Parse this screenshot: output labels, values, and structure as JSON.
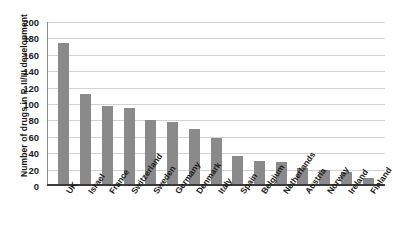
{
  "chart_data": {
    "type": "bar",
    "title": "",
    "xlabel": "",
    "ylabel": "Number of drugs in P. II/III development",
    "ylim": [
      0,
      200
    ],
    "ytick_step": 20,
    "yticks": [
      200,
      180,
      160,
      140,
      120,
      100,
      80,
      60,
      40,
      20,
      0
    ],
    "grid": true,
    "legend": "none",
    "bar_color": "#8a8a8a",
    "categories": [
      "UK",
      "Israel",
      "France",
      "Switzerland",
      "Sweden",
      "Germany",
      "Denmark",
      "Italy",
      "Spain",
      "Belgium",
      "Netherlands",
      "Austria",
      "Norway",
      "Ireland",
      "Finland"
    ],
    "values": [
      174,
      112,
      97,
      95,
      80,
      78,
      69,
      58,
      36,
      31,
      29,
      22,
      20,
      17,
      10
    ]
  }
}
